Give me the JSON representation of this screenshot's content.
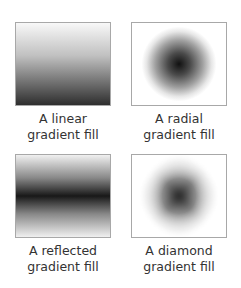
{
  "figures": [
    {
      "type": "linear",
      "caption_line1": "A linear",
      "caption_line2": "gradient fill"
    },
    {
      "type": "radial",
      "caption_line1": "A radial",
      "caption_line2": "gradient fill"
    },
    {
      "type": "reflected",
      "caption_line1": "A reflected",
      "caption_line2": "gradient fill"
    },
    {
      "type": "diamond",
      "caption_line1": "A diamond",
      "caption_line2": "gradient fill"
    }
  ],
  "colors": {
    "dark": "#111111",
    "light": "#ffffff",
    "border": "#a8a8a8",
    "text": "#333333"
  }
}
